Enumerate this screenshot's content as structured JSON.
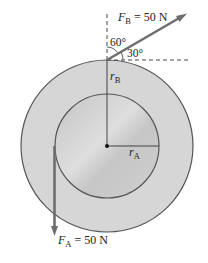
{
  "diagram": {
    "forces": {
      "FB": {
        "symbol": "F",
        "sub": "B",
        "value": " = 50 N"
      },
      "FA": {
        "symbol": "F",
        "sub": "A",
        "value": " = 50 N"
      }
    },
    "angles": {
      "a60": "60°",
      "a30": "30°"
    },
    "radii": {
      "rB": {
        "symbol": "r",
        "sub": "B"
      },
      "rA": {
        "symbol": "r",
        "sub": "A"
      }
    },
    "colors": {
      "outer_fill": "#d4d4d4",
      "inner_fill": "#c8c8c8",
      "stroke": "#555555",
      "arrow": "#6e6e6e"
    }
  }
}
